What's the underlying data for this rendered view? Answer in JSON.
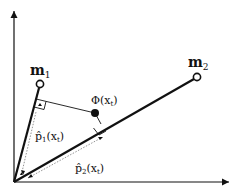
{
  "diagram": {
    "points": {
      "m1": {
        "label": "m",
        "sub": "1"
      },
      "m2": {
        "label": "m",
        "sub": "2"
      },
      "phi": {
        "label": "Φ(x",
        "sub": "t",
        "close": ")"
      }
    },
    "projections": {
      "p1": {
        "label": "p̂",
        "sub": "1",
        "arg": "(x",
        "argsub": "t",
        "close": ")"
      },
      "p2": {
        "label": "p̂",
        "sub": "2",
        "arg": "(x",
        "argsub": "t",
        "close": ")"
      }
    },
    "colors": {
      "line": "#111111",
      "dotted": "#777777",
      "background": "#ffffff"
    }
  }
}
